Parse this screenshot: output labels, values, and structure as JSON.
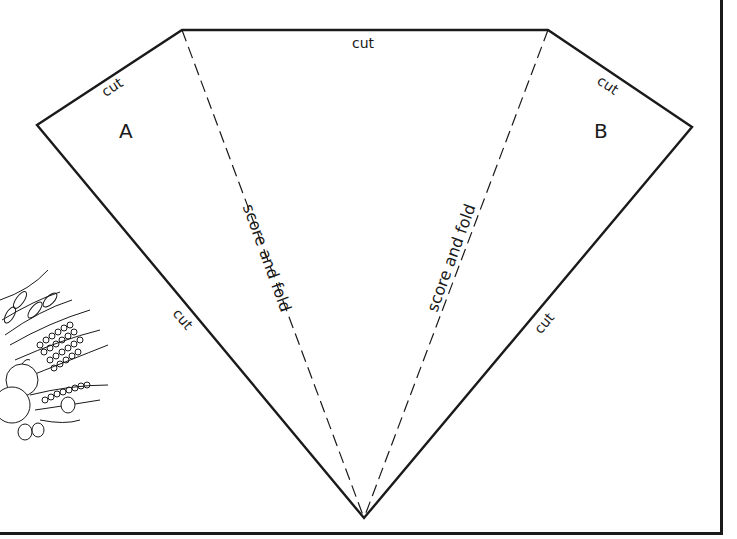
{
  "template": {
    "colors": {
      "line": "#1a1a1a",
      "background": "#ffffff"
    },
    "panels": {
      "left": {
        "letter": "A"
      },
      "right": {
        "letter": "B"
      }
    },
    "edges": {
      "top_cut": "cut",
      "upper_left_cut": "cut",
      "upper_right_cut": "cut",
      "lower_left_cut": "cut",
      "lower_right_cut": "cut"
    },
    "folds": {
      "left": "score and fold",
      "right": "score and fold"
    },
    "vertices": {
      "top_left": [
        182,
        30
      ],
      "top_right": [
        548,
        30
      ],
      "far_left": [
        37,
        125
      ],
      "far_right": [
        692,
        127
      ],
      "bottom": [
        364,
        518
      ]
    },
    "illustration": "harvest-bouquet (wheat, grain, fruit)"
  }
}
